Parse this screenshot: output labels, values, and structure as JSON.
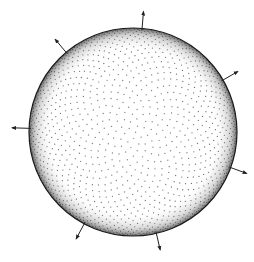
{
  "diagram": {
    "title": "",
    "sphere": {
      "shading": "stipple",
      "dot_color": "#2a2a2a",
      "rim_color": "#1a1a1a",
      "fill_color": "#ffffff"
    },
    "arrows": {
      "color": "#222222",
      "count": 7,
      "items": [
        {
          "name": "normal-arrow-top",
          "direction_deg": 85
        },
        {
          "name": "normal-arrow-upper-left",
          "direction_deg": 130
        },
        {
          "name": "normal-arrow-upper-right",
          "direction_deg": 30
        },
        {
          "name": "normal-arrow-left",
          "direction_deg": 178
        },
        {
          "name": "normal-arrow-lower-right",
          "direction_deg": -20
        },
        {
          "name": "normal-arrow-lower-left",
          "direction_deg": -118
        },
        {
          "name": "normal-arrow-bottom",
          "direction_deg": -77
        }
      ]
    }
  }
}
